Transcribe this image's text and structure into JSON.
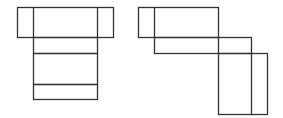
{
  "figure": {
    "width": 283,
    "height": 118,
    "stroke_color": "#333333",
    "background": "#ffffff",
    "nets": [
      {
        "name": "left-net",
        "rects": [
          {
            "x": 17,
            "y": 7,
            "w": 96,
            "h": 30
          },
          {
            "x": 33,
            "y": 37,
            "w": 64,
            "h": 16
          },
          {
            "x": 33,
            "y": 53,
            "w": 64,
            "h": 31
          },
          {
            "x": 33,
            "y": 84,
            "w": 64,
            "h": 15
          }
        ],
        "lines": [
          {
            "x1": 33,
            "y1": 7,
            "x2": 33,
            "y2": 37
          },
          {
            "x1": 97,
            "y1": 7,
            "x2": 97,
            "y2": 37
          }
        ]
      },
      {
        "name": "right-net",
        "rects": [
          {
            "x": 138,
            "y": 7,
            "w": 80,
            "h": 30
          },
          {
            "x": 154,
            "y": 37,
            "w": 97,
            "h": 16
          },
          {
            "x": 218,
            "y": 53,
            "w": 49,
            "h": 61
          }
        ],
        "lines": [
          {
            "x1": 154,
            "y1": 7,
            "x2": 154,
            "y2": 37
          },
          {
            "x1": 218,
            "y1": 37,
            "x2": 218,
            "y2": 53
          },
          {
            "x1": 251,
            "y1": 53,
            "x2": 251,
            "y2": 114
          }
        ]
      }
    ]
  }
}
